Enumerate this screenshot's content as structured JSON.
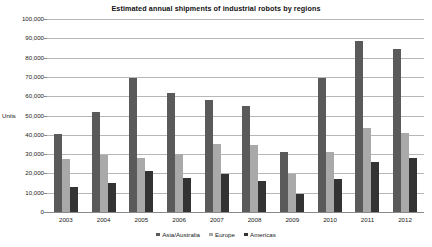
{
  "chart_data": {
    "type": "bar",
    "title": "Estimated annual shipments of industrial robots by regions",
    "xlabel": "",
    "ylabel": "Units",
    "categories": [
      "2003",
      "2004",
      "2005",
      "2006",
      "2007",
      "2008",
      "2009",
      "2010",
      "2011",
      "2012"
    ],
    "series": [
      {
        "name": "Asia/Australia",
        "color": "#5a5a5a",
        "values": [
          40500,
          52000,
          69500,
          61500,
          58000,
          55000,
          31000,
          69500,
          88500,
          84500
        ]
      },
      {
        "name": "Europe",
        "color": "#a9a9a9",
        "values": [
          27500,
          29500,
          28000,
          30000,
          35000,
          34500,
          19500,
          31000,
          43500,
          41000
        ]
      },
      {
        "name": "Americas",
        "color": "#333333",
        "values": [
          12800,
          15000,
          21500,
          17500,
          19500,
          16000,
          9500,
          17000,
          26000,
          28000
        ]
      }
    ],
    "ylim": [
      0,
      100000
    ],
    "ytick_labels": [
      "100,000",
      "90,000",
      "80,000",
      "70,000",
      "60,000",
      "50,000",
      "40,000",
      "30,000",
      "20,000",
      "10,000",
      "0"
    ],
    "ytick_values": [
      100000,
      90000,
      80000,
      70000,
      60000,
      50000,
      40000,
      30000,
      20000,
      10000,
      0
    ],
    "grid": "horizontal",
    "legend_position": "bottom-center",
    "background": "#ffffff",
    "gridline_color": "#b7b7b7"
  }
}
